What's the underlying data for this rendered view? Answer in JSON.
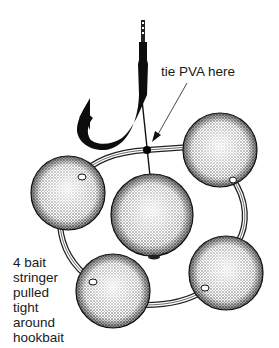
{
  "diagram": {
    "labels": {
      "tie_point": "tie PVA here",
      "stringer_lines": [
        "4 bait",
        "stringer",
        "pulled",
        "tight",
        "around",
        "hookbait"
      ]
    },
    "elements": {
      "hook": "hook-icon",
      "hookbait": "hookbait-ball",
      "stringer_baits": [
        "bait-top-right",
        "bait-left",
        "bait-bottom-right",
        "bait-bottom-left"
      ],
      "knot": "pva-knot"
    },
    "colors": {
      "ink": "#111111",
      "paper": "#ffffff",
      "stipple_light": "#f2f2f2"
    }
  }
}
